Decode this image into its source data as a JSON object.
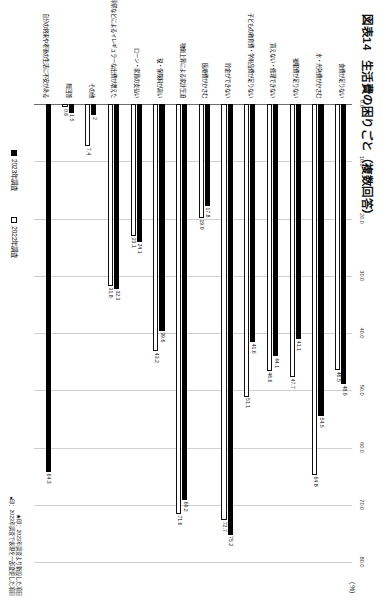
{
  "figure": {
    "number": "図表14",
    "title": "生活費の困りごと",
    "subtitle": "（複数回答）",
    "unit_label": "（%）"
  },
  "legend": {
    "items": [
      {
        "label": "2023年調査",
        "swatch": "black",
        "color": "#000000"
      },
      {
        "label": "2022年調査",
        "swatch": "white",
        "color": "#ffffff"
      }
    ]
  },
  "footnotes": [
    "★印：2023年調査より新設した項目",
    "●印：2023年調査で表現を一部変更した項目"
  ],
  "chart_data": {
    "type": "bar",
    "orientation": "horizontal",
    "xlabel": "（%）",
    "ylabel": "",
    "xlim": [
      0,
      80
    ],
    "xticks": [
      "0.0",
      "10.0",
      "20.0",
      "30.0",
      "40.0",
      "50.0",
      "60.0",
      "70.0",
      "80.0"
    ],
    "grid": true,
    "legend_position": "bottom",
    "categories": [
      "食費が足りない",
      "水・光熱費が high かさむ",
      "被服費が足りない",
      "買えない・修理できない",
      "子どもの教育費・学用品費が足りない",
      "貯金ができない",
      "医療費がかさむ",
      "物価上昇による家計圧迫",
      "税・保険料が高い",
      "ローン・家賃の支払い",
      "冠婚葬祭などによるイレギュラーな出費が増えた",
      "その他",
      "無回答",
      "自分の将来や老後の生活に不安がある"
    ],
    "series": [
      {
        "name": "2023年調査",
        "color": "#000000",
        "values": [
          48.9,
          54.5,
          41.1,
          44.1,
          41.6,
          75.2,
          17.8,
          69.2,
          39.6,
          24.1,
          32.3,
          2.0,
          1.5,
          64.3
        ]
      },
      {
        "name": "2022年調査",
        "color": "#ffffff",
        "values": [
          46.5,
          64.8,
          47.7,
          46.6,
          51.1,
          72.7,
          19.9,
          71.6,
          43.2,
          23.1,
          31.8,
          7.4,
          0.6,
          null
        ]
      }
    ],
    "bar_value_labels": {
      "2023年調査": [
        "48.9",
        "54.5",
        "41.1",
        "44.1",
        "41.6",
        "75.2",
        "17.8",
        "69.2",
        "39.6",
        "24.1",
        "32.3",
        "2",
        "1.5",
        "64.3"
      ],
      "2022年調査": [
        "46.5",
        "64.8",
        "47.7",
        "46.6",
        "51.1",
        "72.7",
        "19.9",
        "71.6",
        "43.2",
        "23.1",
        "31.8",
        "7.4",
        "0.6",
        ""
      ]
    }
  },
  "rows": [
    {
      "label": "食費が足りない",
      "v2023": 48.9,
      "v2022": 46.5,
      "t2023": "48.9",
      "t2022": "46.5"
    },
    {
      "label": "水・光熱費がかさむ",
      "v2023": 54.5,
      "v2022": 64.8,
      "t2023": "54.5",
      "t2022": "64.8"
    },
    {
      "label": "被服費が足りない",
      "v2023": 41.1,
      "v2022": 47.7,
      "t2023": "41.1",
      "t2022": "47.7"
    },
    {
      "label": "買えない・修理できない",
      "v2023": 44.1,
      "v2022": 46.6,
      "t2023": "44.1",
      "t2022": "46.6"
    },
    {
      "label": "子どもの教育費・学用品費が足りない",
      "v2023": 41.6,
      "v2022": 51.1,
      "t2023": "41.6",
      "t2022": "51.1"
    },
    {
      "label": "貯金ができない",
      "v2023": 75.2,
      "v2022": 72.7,
      "t2023": "75.2",
      "t2022": "72.7"
    },
    {
      "label": "医療費がかさむ",
      "v2023": 17.8,
      "v2022": 19.9,
      "t2023": "17.8",
      "t2022": "19.9"
    },
    {
      "label": "物価上昇による家計圧迫",
      "v2023": 69.2,
      "v2022": 71.6,
      "t2023": "69.2",
      "t2022": "71.6"
    },
    {
      "label": "税・保険料が高い",
      "v2023": 39.6,
      "v2022": 43.2,
      "t2023": "39.6",
      "t2022": "43.2"
    },
    {
      "label": "ローン・家賃の支払い",
      "v2023": 24.1,
      "v2022": 23.1,
      "t2023": "24.1",
      "t2022": "23.1"
    },
    {
      "label": "冠婚葬祭などによるイレギュラーな出費が増えた",
      "v2023": 32.3,
      "v2022": 31.8,
      "t2023": "32.3",
      "t2022": "31.8"
    },
    {
      "label": "その他",
      "v2023": 2.0,
      "v2022": 7.4,
      "t2023": "2",
      "t2022": "7.4"
    },
    {
      "label": "無回答",
      "v2023": 1.5,
      "v2022": 0.6,
      "t2023": "1.5",
      "t2022": "0.6"
    },
    {
      "label": "自分の将来や老後の生活に不安がある",
      "v2023": 64.3,
      "v2022": null,
      "t2023": "64.3",
      "t2022": ""
    }
  ],
  "axis": {
    "ticks": [
      "0.0",
      "10.0",
      "20.0",
      "30.0",
      "40.0",
      "50.0",
      "60.0",
      "70.0",
      "80.0"
    ],
    "max": 80
  }
}
